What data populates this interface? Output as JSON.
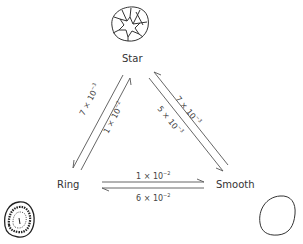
{
  "diagram": {
    "nodes": {
      "star": {
        "label": "Star",
        "icon": "star-colony-icon"
      },
      "ring": {
        "label": "Ring",
        "icon": "ring-colony-icon"
      },
      "smooth": {
        "label": "Smooth",
        "icon": "smooth-colony-icon"
      }
    },
    "transitions": {
      "ring_to_star": {
        "from": "Ring",
        "to": "Star",
        "coef": "1",
        "exp": "−2"
      },
      "star_to_ring": {
        "from": "Star",
        "to": "Ring",
        "coef": "7",
        "exp": "−3"
      },
      "smooth_to_star": {
        "from": "Smooth",
        "to": "Star",
        "coef": "7",
        "exp": "−3"
      },
      "star_to_smooth": {
        "from": "Star",
        "to": "Smooth",
        "coef": "5",
        "exp": "−3"
      },
      "ring_to_smooth": {
        "from": "Ring",
        "to": "Smooth",
        "coef": "1",
        "exp": "−2"
      },
      "smooth_to_ring": {
        "from": "Smooth",
        "to": "Ring",
        "coef": "6",
        "exp": "−2"
      }
    },
    "times": "×",
    "base": "10",
    "colors": {
      "line": "#555555",
      "text": "#333333"
    }
  }
}
